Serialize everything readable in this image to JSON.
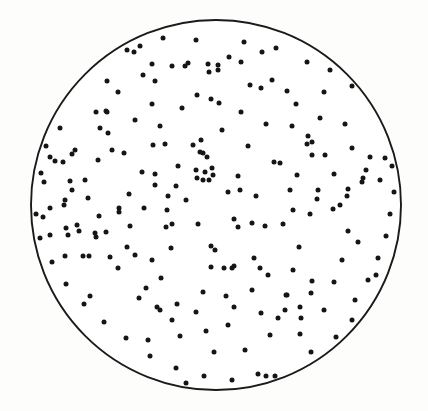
{
  "figure": {
    "title": "",
    "caption": ""
  },
  "chart_data": {
    "type": "scatter",
    "title": "",
    "subtitle": "",
    "xlabel": "",
    "ylabel": "",
    "grid": false,
    "legend": null,
    "axes_visible": false,
    "tick_labels": [],
    "annotations": [],
    "boundary": {
      "shape": "circle",
      "cx": 216,
      "cy": 205,
      "r": 185,
      "stroke_color": "#1a1a1a",
      "stroke_width": 1.9,
      "fill_color": "#ffffff"
    },
    "xlim": [
      0,
      428
    ],
    "ylim": [
      0,
      411
    ],
    "marker": {
      "shape": "circle",
      "radius": 2.5,
      "color": "#151515"
    },
    "n_points": 223,
    "points": [
      [
        127,
        50
      ],
      [
        134,
        52
      ],
      [
        152,
        64
      ],
      [
        172,
        66
      ],
      [
        185,
        66
      ],
      [
        188,
        63
      ],
      [
        208,
        64
      ],
      [
        209,
        72
      ],
      [
        107,
        81
      ],
      [
        143,
        75
      ],
      [
        155,
        81
      ],
      [
        197,
        95
      ],
      [
        211,
        99
      ],
      [
        107,
        112
      ],
      [
        152,
        104
      ],
      [
        229,
        57
      ],
      [
        241,
        62
      ],
      [
        307,
        62
      ],
      [
        218,
        65
      ],
      [
        218,
        70
      ],
      [
        250,
        85
      ],
      [
        261,
        88
      ],
      [
        287,
        91
      ],
      [
        324,
        92
      ],
      [
        219,
        103
      ],
      [
        241,
        112
      ],
      [
        59,
        113
      ],
      [
        96,
        112
      ],
      [
        106,
        111
      ],
      [
        100,
        128
      ],
      [
        108,
        133
      ],
      [
        75,
        150
      ],
      [
        72,
        154
      ],
      [
        50,
        157
      ],
      [
        55,
        161
      ],
      [
        63,
        162
      ],
      [
        41,
        173
      ],
      [
        124,
        153
      ],
      [
        85,
        180
      ],
      [
        70,
        181
      ],
      [
        44,
        182
      ],
      [
        72,
        190
      ],
      [
        129,
        194
      ],
      [
        65,
        200
      ],
      [
        292,
        126
      ],
      [
        345,
        124
      ],
      [
        308,
        136
      ],
      [
        307,
        144
      ],
      [
        312,
        142
      ],
      [
        312,
        155
      ],
      [
        325,
        155
      ],
      [
        370,
        157
      ],
      [
        385,
        158
      ],
      [
        280,
        163
      ],
      [
        366,
        170
      ],
      [
        297,
        175
      ],
      [
        363,
        178
      ],
      [
        362,
        182
      ],
      [
        380,
        180
      ],
      [
        348,
        189
      ],
      [
        347,
        196
      ],
      [
        318,
        190
      ],
      [
        317,
        199
      ],
      [
        153,
        145
      ],
      [
        165,
        144
      ],
      [
        193,
        145
      ],
      [
        201,
        140
      ],
      [
        200,
        152
      ],
      [
        203,
        153
      ],
      [
        207,
        157
      ],
      [
        178,
        166
      ],
      [
        155,
        174
      ],
      [
        196,
        170
      ],
      [
        205,
        172
      ],
      [
        197,
        178
      ],
      [
        203,
        180
      ],
      [
        209,
        180
      ],
      [
        212,
        168
      ],
      [
        213,
        175
      ],
      [
        176,
        186
      ],
      [
        155,
        185
      ],
      [
        50,
        208
      ],
      [
        64,
        205
      ],
      [
        119,
        208
      ],
      [
        119,
        212
      ],
      [
        99,
        216
      ],
      [
        43,
        217
      ],
      [
        66,
        228
      ],
      [
        77,
        225
      ],
      [
        79,
        231
      ],
      [
        50,
        235
      ],
      [
        68,
        235
      ],
      [
        95,
        233
      ],
      [
        96,
        237
      ],
      [
        127,
        247
      ],
      [
        110,
        257
      ],
      [
        65,
        256
      ],
      [
        83,
        256
      ],
      [
        89,
        256
      ],
      [
        135,
        255
      ],
      [
        167,
        210
      ],
      [
        166,
        227
      ],
      [
        172,
        224
      ],
      [
        198,
        224
      ],
      [
        234,
        219
      ],
      [
        238,
        227
      ],
      [
        252,
        223
      ],
      [
        171,
        248
      ],
      [
        211,
        246
      ],
      [
        215,
        250
      ],
      [
        152,
        260
      ],
      [
        254,
        258
      ],
      [
        211,
        267
      ],
      [
        224,
        268
      ],
      [
        232,
        268
      ],
      [
        234,
        266
      ],
      [
        260,
        268
      ],
      [
        161,
        278
      ],
      [
        203,
        292
      ],
      [
        293,
        210
      ],
      [
        310,
        214
      ],
      [
        333,
        209
      ],
      [
        340,
        205
      ],
      [
        265,
        226
      ],
      [
        283,
        224
      ],
      [
        348,
        231
      ],
      [
        299,
        247
      ],
      [
        342,
        260
      ],
      [
        293,
        270
      ],
      [
        312,
        281
      ],
      [
        334,
        282
      ],
      [
        268,
        275
      ],
      [
        311,
        293
      ],
      [
        287,
        295
      ],
      [
        376,
        275
      ],
      [
        90,
        296
      ],
      [
        139,
        298
      ],
      [
        157,
        307
      ],
      [
        160,
        310
      ],
      [
        177,
        304
      ],
      [
        83,
        329
      ],
      [
        148,
        340
      ],
      [
        180,
        336
      ],
      [
        206,
        331
      ],
      [
        214,
        352
      ],
      [
        186,
        383
      ],
      [
        234,
        307
      ],
      [
        261,
        313
      ],
      [
        285,
        310
      ],
      [
        286,
        295
      ],
      [
        300,
        307
      ],
      [
        301,
        318
      ],
      [
        228,
        325
      ],
      [
        270,
        335
      ],
      [
        336,
        337
      ],
      [
        245,
        350
      ],
      [
        311,
        352
      ],
      [
        316,
        364
      ],
      [
        275,
        376
      ],
      [
        296,
        378
      ],
      [
        266,
        376
      ],
      [
        140,
        46
      ],
      [
        163,
        38
      ],
      [
        196,
        40
      ],
      [
        244,
        42
      ],
      [
        262,
        52
      ],
      [
        276,
        48
      ],
      [
        330,
        70
      ],
      [
        352,
        86
      ],
      [
        368,
        104
      ],
      [
        380,
        120
      ],
      [
        388,
        140
      ],
      [
        392,
        166
      ],
      [
        394,
        192
      ],
      [
        390,
        214
      ],
      [
        386,
        236
      ],
      [
        378,
        258
      ],
      [
        368,
        280
      ],
      [
        355,
        300
      ],
      [
        60,
        128
      ],
      [
        46,
        146
      ],
      [
        38,
        166
      ],
      [
        34,
        190
      ],
      [
        36,
        214
      ],
      [
        40,
        238
      ],
      [
        52,
        262
      ],
      [
        66,
        284
      ],
      [
        84,
        304
      ],
      [
        104,
        322
      ],
      [
        126,
        338
      ],
      [
        150,
        356
      ],
      [
        176,
        368
      ],
      [
        204,
        376
      ],
      [
        232,
        380
      ],
      [
        258,
        374
      ],
      [
        112,
        150
      ],
      [
        135,
        120
      ],
      [
        118,
        92
      ],
      [
        98,
        160
      ],
      [
        88,
        198
      ],
      [
        106,
        232
      ],
      [
        142,
        172
      ],
      [
        160,
        126
      ],
      [
        182,
        108
      ],
      [
        222,
        130
      ],
      [
        248,
        146
      ],
      [
        266,
        124
      ],
      [
        274,
        162
      ],
      [
        290,
        190
      ],
      [
        256,
        196
      ],
      [
        238,
        176
      ],
      [
        228,
        192
      ],
      [
        186,
        200
      ],
      [
        168,
        196
      ],
      [
        144,
        208
      ],
      [
        130,
        226
      ],
      [
        118,
        268
      ],
      [
        146,
        288
      ],
      [
        172,
        320
      ],
      [
        196,
        312
      ],
      [
        226,
        296
      ],
      [
        252,
        290
      ],
      [
        278,
        318
      ],
      [
        300,
        334
      ],
      [
        324,
        310
      ],
      [
        352,
        320
      ],
      [
        358,
        242
      ],
      [
        334,
        174
      ],
      [
        352,
        148
      ],
      [
        320,
        118
      ],
      [
        296,
        104
      ],
      [
        272,
        80
      ],
      [
        240,
        190
      ]
    ]
  }
}
